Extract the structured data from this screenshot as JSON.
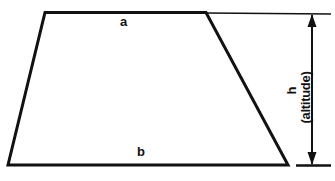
{
  "figure": {
    "type": "geometry-diagram",
    "shape": "trapezoid",
    "background_color": "#ffffff",
    "stroke_color": "#111111",
    "labels": {
      "top_base": "a",
      "bottom_base": "b",
      "height": "h",
      "height_note": "(altitude)"
    },
    "geometry": {
      "vertices": {
        "top_left": [
          45,
          13
        ],
        "top_right": [
          206,
          13
        ],
        "bottom_right": [
          288,
          165
        ],
        "bottom_left": [
          8,
          165
        ]
      },
      "dimension_line_x": 312,
      "dimension_top_y": 13,
      "dimension_bottom_y": 165,
      "extension_line_end_x": 331
    }
  }
}
